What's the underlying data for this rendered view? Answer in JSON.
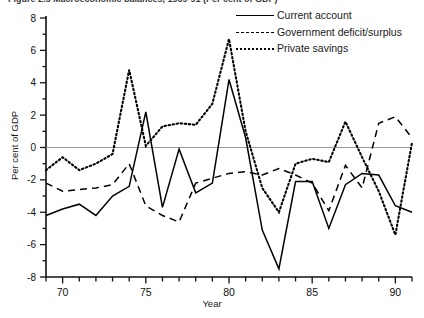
{
  "figure": {
    "title_fragment": "Figure 2.5   Macroeconomic balances, 1969-91 (Per cent of GDP)"
  },
  "legend": {
    "position": "top-right",
    "items": [
      {
        "label": "Current account",
        "style": "solid",
        "key_name": "legend-key-current-account"
      },
      {
        "label": "Government deficit/surplus",
        "style": "dashed",
        "key_name": "legend-key-government"
      },
      {
        "label": "Private savings",
        "style": "dotted",
        "key_name": "legend-key-private-savings"
      }
    ]
  },
  "axes": {
    "ylabel": "Per cent of GDP",
    "xlabel": "Year",
    "yticks": [
      "8",
      "6",
      "4",
      "2",
      "0",
      "-2",
      "-4",
      "-6",
      "-8"
    ],
    "xticks": [
      "70",
      "75",
      "80",
      "85",
      "90"
    ],
    "zero_line": "0"
  },
  "chart_data": {
    "type": "line",
    "xlabel": "Year",
    "ylabel": "Per cent of GDP",
    "xlim": [
      1969,
      1991
    ],
    "ylim": [
      -8,
      8
    ],
    "yticks": [
      -8,
      -6,
      -4,
      -2,
      0,
      2,
      4,
      6,
      8
    ],
    "xticks": [
      70,
      75,
      80,
      85,
      90
    ],
    "grid": false,
    "legend_position": "top right",
    "x": [
      1969,
      1970,
      1971,
      1972,
      1973,
      1974,
      1975,
      1976,
      1977,
      1978,
      1979,
      1980,
      1981,
      1982,
      1983,
      1984,
      1985,
      1986,
      1987,
      1988,
      1989,
      1990,
      1991
    ],
    "series": [
      {
        "name": "Current account",
        "style": "solid",
        "values": [
          -4.2,
          -3.8,
          -3.5,
          -4.2,
          -3.0,
          -2.4,
          2.2,
          -3.7,
          -0.1,
          -2.8,
          -2.2,
          4.2,
          0.6,
          -5.1,
          -7.5,
          -2.1,
          -2.1,
          -5.0,
          -2.3,
          -1.6,
          -1.7,
          -3.6,
          -4.0
        ]
      },
      {
        "name": "Government deficit/surplus",
        "style": "dashed",
        "values": [
          -2.2,
          -2.7,
          -2.6,
          -2.5,
          -2.3,
          -1.0,
          -3.6,
          -4.2,
          -4.6,
          -2.2,
          -1.9,
          -1.6,
          -1.5,
          -1.7,
          -1.3,
          -1.7,
          -2.2,
          -3.9,
          -1.1,
          -2.5,
          1.5,
          1.9,
          0.6
        ]
      },
      {
        "name": "Private savings",
        "style": "dotted",
        "values": [
          -1.4,
          -0.6,
          -1.4,
          -1.0,
          -0.4,
          4.8,
          0.1,
          1.3,
          1.5,
          1.4,
          2.7,
          6.7,
          1.0,
          -2.5,
          -4.0,
          -1.0,
          -0.7,
          -0.9,
          1.6,
          -0.6,
          -2.7,
          -5.4,
          0.3
        ]
      }
    ]
  }
}
